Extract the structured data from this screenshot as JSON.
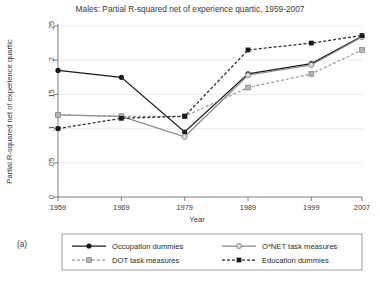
{
  "figure": {
    "panel_label": "(a)",
    "title": "Males: Partial R-squared net of experience quartic, 1959-2007"
  },
  "chart_data": {
    "type": "line",
    "title": "Males: Partial R-squared net of experience quartic, 1959-2007",
    "xlabel": "Year",
    "ylabel": "Partial R-squared net of experience quartic",
    "x": [
      1959,
      1969,
      1979,
      1989,
      1999,
      2007
    ],
    "xtick_labels": [
      "1959",
      "1969",
      "1979",
      "1989",
      "1999",
      "2007"
    ],
    "ytick_values": [
      0,
      0.05,
      0.1,
      0.15,
      0.2,
      0.25
    ],
    "ytick_labels": [
      "0",
      ".05",
      ".1",
      ".15",
      ".2",
      ".25"
    ],
    "xlim": [
      1959,
      2007
    ],
    "ylim": [
      0,
      0.25
    ],
    "grid": "horizontal",
    "legend_position": "below-axes",
    "series": [
      {
        "name": "Occupation dummies",
        "values": [
          0.185,
          0.175,
          0.095,
          0.18,
          0.195,
          0.235
        ],
        "line_style": "solid",
        "marker": "circle-filled",
        "color": "#1a1a1a"
      },
      {
        "name": "O*NET task measures",
        "values": [
          0.12,
          0.118,
          0.088,
          0.178,
          0.193,
          0.234
        ],
        "line_style": "solid",
        "marker": "circle-hollow",
        "color": "#8a8a8a"
      },
      {
        "name": "DOT task measures",
        "values": [
          0.12,
          0.118,
          0.118,
          0.16,
          0.18,
          0.215
        ],
        "line_style": "dashed",
        "marker": "square-light",
        "color": "#9a9a9a"
      },
      {
        "name": "Education dummies",
        "values": [
          0.1,
          0.115,
          0.118,
          0.215,
          0.225,
          0.236
        ],
        "line_style": "dashed",
        "marker": "square-filled",
        "color": "#2a2a2a"
      }
    ]
  },
  "colors": {
    "axis": "#6f6f6f",
    "grid": "#e2e2e2",
    "text": "#3a3a3a",
    "background": "#ffffff"
  }
}
